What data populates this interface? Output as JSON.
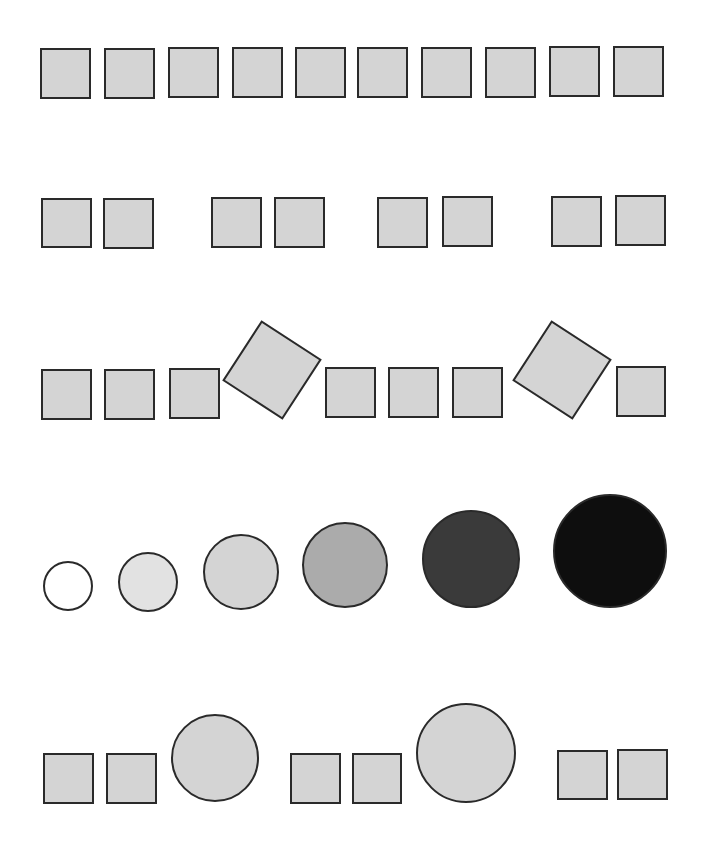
{
  "figure": {
    "colors": {
      "stroke": "#2a2a2a",
      "square_fill": "#d4d4d4",
      "circle_fills": [
        "#ffffff",
        "#e2e2e2",
        "#d4d4d4",
        "#ababab",
        "#3a3a3a",
        "#0e0e0e"
      ]
    },
    "rows": [
      {
        "name": "row-1-ten-squares",
        "shapes": [
          {
            "type": "square",
            "x": 41,
            "y": 49,
            "w": 49,
            "h": 49
          },
          {
            "type": "square",
            "x": 105,
            "y": 49,
            "w": 49,
            "h": 49
          },
          {
            "type": "square",
            "x": 169,
            "y": 48,
            "w": 49,
            "h": 49
          },
          {
            "type": "square",
            "x": 233,
            "y": 48,
            "w": 49,
            "h": 49
          },
          {
            "type": "square",
            "x": 296,
            "y": 48,
            "w": 49,
            "h": 49
          },
          {
            "type": "square",
            "x": 358,
            "y": 48,
            "w": 49,
            "h": 49
          },
          {
            "type": "square",
            "x": 422,
            "y": 48,
            "w": 49,
            "h": 49
          },
          {
            "type": "square",
            "x": 486,
            "y": 48,
            "w": 49,
            "h": 49
          },
          {
            "type": "square",
            "x": 550,
            "y": 47,
            "w": 49,
            "h": 49
          },
          {
            "type": "square",
            "x": 614,
            "y": 47,
            "w": 49,
            "h": 49
          }
        ]
      },
      {
        "name": "row-2-square-pairs",
        "shapes": [
          {
            "type": "square",
            "x": 42,
            "y": 199,
            "w": 49,
            "h": 48
          },
          {
            "type": "square",
            "x": 104,
            "y": 199,
            "w": 49,
            "h": 49
          },
          {
            "type": "square",
            "x": 212,
            "y": 198,
            "w": 49,
            "h": 49
          },
          {
            "type": "square",
            "x": 275,
            "y": 198,
            "w": 49,
            "h": 49
          },
          {
            "type": "square",
            "x": 378,
            "y": 198,
            "w": 49,
            "h": 49
          },
          {
            "type": "square",
            "x": 443,
            "y": 197,
            "w": 49,
            "h": 49
          },
          {
            "type": "square",
            "x": 552,
            "y": 197,
            "w": 49,
            "h": 49
          },
          {
            "type": "square",
            "x": 616,
            "y": 196,
            "w": 49,
            "h": 49
          }
        ]
      },
      {
        "name": "row-3-squares-with-rotated",
        "shapes": [
          {
            "type": "square",
            "x": 42,
            "y": 370,
            "w": 49,
            "h": 49
          },
          {
            "type": "square",
            "x": 105,
            "y": 370,
            "w": 49,
            "h": 49
          },
          {
            "type": "square",
            "x": 170,
            "y": 369,
            "w": 49,
            "h": 49
          },
          {
            "type": "rotated-square",
            "cx": 272,
            "cy": 370,
            "size": 70,
            "angle": 33
          },
          {
            "type": "square",
            "x": 326,
            "y": 368,
            "w": 49,
            "h": 49
          },
          {
            "type": "square",
            "x": 389,
            "y": 368,
            "w": 49,
            "h": 49
          },
          {
            "type": "square",
            "x": 453,
            "y": 368,
            "w": 49,
            "h": 49
          },
          {
            "type": "rotated-square",
            "cx": 562,
            "cy": 370,
            "size": 70,
            "angle": 33
          },
          {
            "type": "square",
            "x": 617,
            "y": 367,
            "w": 48,
            "h": 49
          }
        ]
      },
      {
        "name": "row-4-growing-circles",
        "shapes": [
          {
            "type": "circle",
            "cx": 68,
            "cy": 586,
            "r": 24,
            "fill_index": 0
          },
          {
            "type": "circle",
            "cx": 148,
            "cy": 582,
            "r": 29,
            "fill_index": 1
          },
          {
            "type": "circle",
            "cx": 241,
            "cy": 572,
            "r": 37,
            "fill_index": 2
          },
          {
            "type": "circle",
            "cx": 345,
            "cy": 565,
            "r": 42,
            "fill_index": 3
          },
          {
            "type": "circle",
            "cx": 471,
            "cy": 559,
            "r": 48,
            "fill_index": 4
          },
          {
            "type": "circle",
            "cx": 610,
            "cy": 551,
            "r": 56,
            "fill_index": 5
          }
        ]
      },
      {
        "name": "row-5-squares-and-circles",
        "shapes": [
          {
            "type": "square",
            "x": 44,
            "y": 754,
            "w": 49,
            "h": 49
          },
          {
            "type": "square",
            "x": 107,
            "y": 754,
            "w": 49,
            "h": 49
          },
          {
            "type": "circle",
            "cx": 215,
            "cy": 758,
            "r": 43,
            "fill_index": 2
          },
          {
            "type": "square",
            "x": 291,
            "y": 754,
            "w": 49,
            "h": 49
          },
          {
            "type": "square",
            "x": 353,
            "y": 754,
            "w": 48,
            "h": 49
          },
          {
            "type": "circle",
            "cx": 466,
            "cy": 753,
            "r": 49,
            "fill_index": 2
          },
          {
            "type": "square",
            "x": 558,
            "y": 751,
            "w": 49,
            "h": 48
          },
          {
            "type": "square",
            "x": 618,
            "y": 750,
            "w": 49,
            "h": 49
          }
        ]
      }
    ]
  }
}
